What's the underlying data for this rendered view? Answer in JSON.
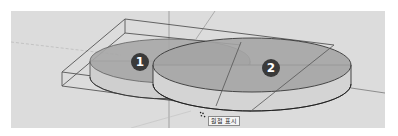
{
  "viewport": {
    "background": "#dcdcdc",
    "objects": [
      {
        "label": "1",
        "shape": "cylinder-disc",
        "fill": "#a8a8a8"
      },
      {
        "label": "2",
        "shape": "cylinder-disc",
        "fill": "#a5a5a5"
      }
    ],
    "bounding_box": {
      "color": "#555555"
    },
    "cursor_tooltip": "원점 표시"
  }
}
